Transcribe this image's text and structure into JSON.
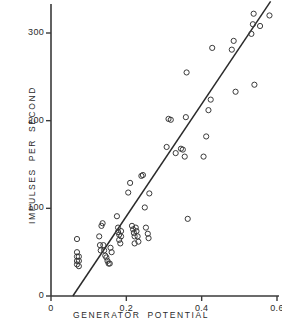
{
  "chart_data": {
    "type": "scatter",
    "title": "",
    "xlabel": "GENERATOR  POTENTIAL",
    "ylabel": "IMPULSES  PER  SECOND",
    "xlim": [
      0,
      0.6
    ],
    "ylim": [
      0,
      340
    ],
    "xticks": [
      0,
      0.2,
      0.4,
      0.6
    ],
    "xtick_labels": [
      "0",
      "0.2",
      "0.4",
      "0.6"
    ],
    "yticks": [
      0,
      100,
      200,
      300
    ],
    "ytick_labels": [
      "0",
      "100",
      "200",
      "300"
    ],
    "grid": false,
    "legend": null,
    "marker": "open-circle",
    "marker_color": "#3a3a3a",
    "line_color": "#2b2b2b",
    "axis_color": "#3a3a3a",
    "points": [
      [
        0.069,
        65
      ],
      [
        0.069,
        50
      ],
      [
        0.069,
        45
      ],
      [
        0.069,
        40
      ],
      [
        0.069,
        36
      ],
      [
        0.074,
        45
      ],
      [
        0.074,
        40
      ],
      [
        0.074,
        34
      ],
      [
        0.128,
        68
      ],
      [
        0.13,
        58
      ],
      [
        0.132,
        52
      ],
      [
        0.134,
        80
      ],
      [
        0.137,
        83
      ],
      [
        0.139,
        58
      ],
      [
        0.141,
        52
      ],
      [
        0.144,
        46
      ],
      [
        0.147,
        44
      ],
      [
        0.15,
        40
      ],
      [
        0.153,
        37
      ],
      [
        0.156,
        37
      ],
      [
        0.158,
        55
      ],
      [
        0.161,
        50
      ],
      [
        0.175,
        91
      ],
      [
        0.178,
        78
      ],
      [
        0.178,
        73
      ],
      [
        0.181,
        70
      ],
      [
        0.181,
        64
      ],
      [
        0.184,
        60
      ],
      [
        0.186,
        74
      ],
      [
        0.186,
        68
      ],
      [
        0.205,
        118
      ],
      [
        0.21,
        129
      ],
      [
        0.215,
        80
      ],
      [
        0.218,
        76
      ],
      [
        0.22,
        72
      ],
      [
        0.222,
        68
      ],
      [
        0.222,
        60
      ],
      [
        0.225,
        78
      ],
      [
        0.227,
        74
      ],
      [
        0.23,
        68
      ],
      [
        0.232,
        62
      ],
      [
        0.24,
        137
      ],
      [
        0.244,
        138
      ],
      [
        0.249,
        101
      ],
      [
        0.252,
        78
      ],
      [
        0.257,
        71
      ],
      [
        0.259,
        66
      ],
      [
        0.261,
        117
      ],
      [
        0.307,
        170
      ],
      [
        0.312,
        202
      ],
      [
        0.318,
        201
      ],
      [
        0.331,
        163
      ],
      [
        0.345,
        168
      ],
      [
        0.35,
        167
      ],
      [
        0.355,
        159
      ],
      [
        0.358,
        204
      ],
      [
        0.36,
        255
      ],
      [
        0.363,
        88
      ],
      [
        0.405,
        159
      ],
      [
        0.412,
        182
      ],
      [
        0.418,
        212
      ],
      [
        0.424,
        224
      ],
      [
        0.428,
        283
      ],
      [
        0.48,
        281
      ],
      [
        0.485,
        291
      ],
      [
        0.49,
        233
      ],
      [
        0.532,
        299
      ],
      [
        0.536,
        310
      ],
      [
        0.538,
        322
      ],
      [
        0.54,
        241
      ],
      [
        0.555,
        308
      ],
      [
        0.58,
        320
      ]
    ],
    "fit_line": {
      "x_start": 0.058,
      "y_start": 0,
      "x_end": 0.583,
      "y_end": 336
    }
  }
}
